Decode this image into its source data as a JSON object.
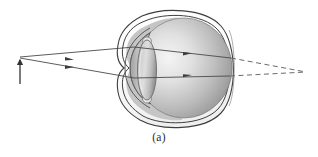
{
  "figure": {
    "caption": "(a)",
    "type": "optics-ray-diagram",
    "width": 318,
    "height": 157
  },
  "colors": {
    "outline": "#4a4a4a",
    "outline_dark": "#2e2e2e",
    "ray": "#4a4a4a",
    "dashed_ray": "#6b6b6b",
    "sclera_fill": "#ffffff",
    "vitreous_light": "#f2f2f2",
    "vitreous_mid": "#b9b9b9",
    "vitreous_dark": "#7d7d7d",
    "cornea_fill": "#c9c9c9",
    "lens_light": "#e2e2e2",
    "lens_mid": "#bdbdbd",
    "lens_dark": "#9a9a9a",
    "object_arrow": "#333333",
    "background": "#ffffff",
    "caption_text": "#2b2b2b"
  },
  "object": {
    "label": "object-arrow",
    "x": 20,
    "tip_y": 57,
    "base_y": 84
  },
  "eyeball": {
    "label": "eyeball",
    "cx": 183,
    "cy": 68,
    "rx": 51,
    "ry": 58,
    "sclera_outer_offset": 4
  },
  "cornea": {
    "label": "cornea",
    "apex_x": 124,
    "top_y": 34,
    "bottom_y": 104
  },
  "lens": {
    "label": "crystalline-lens",
    "cx": 146,
    "cy": 70,
    "rx": 9,
    "ry": 30
  },
  "retina": {
    "label": "retina",
    "hit_upper_y": 58,
    "hit_lower_y": 76,
    "hit_x": 230
  },
  "rays": [
    {
      "name": "ray-upper",
      "from_x": 20,
      "from_y": 57,
      "entry_x": 134,
      "entry_y": 47,
      "exit_x": 230,
      "exit_y": 58,
      "arrow_in_x": 71,
      "arrow_out_x": 188
    },
    {
      "name": "ray-lower",
      "from_x": 20,
      "from_y": 58,
      "entry_x": 134,
      "entry_y": 78,
      "exit_x": 229,
      "exit_y": 76,
      "arrow_in_x": 71,
      "arrow_out_x": 188
    }
  ],
  "virtual_focus": {
    "label": "image-point-behind-retina",
    "x": 306,
    "y": 72
  },
  "dashed_extensions": [
    {
      "name": "dashed-upper",
      "x1": 230,
      "y1": 58,
      "x2": 306,
      "y2": 72
    },
    {
      "name": "dashed-lower",
      "x1": 229,
      "y1": 76,
      "x2": 306,
      "y2": 72
    }
  ]
}
